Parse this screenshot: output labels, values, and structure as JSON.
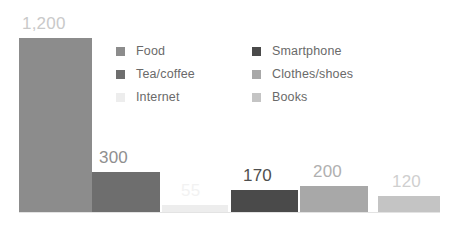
{
  "chart_data": {
    "type": "bar",
    "title": "",
    "subtitle": "",
    "xlabel": "",
    "ylabel": "",
    "grid": false,
    "legend_position": "top-center",
    "categories": [
      "Food",
      "Tea/coffee",
      "Internet",
      "Smartphone",
      "Clothes/shoes",
      "Books"
    ],
    "values": [
      1200,
      300,
      55,
      170,
      200,
      120
    ],
    "value_labels": [
      "1,200",
      "300",
      "55",
      "170",
      "200",
      "120"
    ],
    "colors": [
      "#8c8c8c",
      "#6e6e6e",
      "#ededed",
      "#4a4a4a",
      "#a8a8a8",
      "#c4c4c4"
    ],
    "label_colors": [
      "#c9c9c9",
      "#8f8f8f",
      "#f2f2f2",
      "#4f4f4f",
      "#b0b0b0",
      "#cfcfcf"
    ],
    "bars": [
      {
        "category": "Food",
        "value": 1200,
        "label": "1,200",
        "color": "#8c8c8c",
        "label_color": "#c9c9c9",
        "x": 19,
        "width": 73,
        "top": 38,
        "height": 174,
        "label_x": 22,
        "label_y": 15
      },
      {
        "category": "Tea/coffee",
        "value": 300,
        "label": "300",
        "color": "#6e6e6e",
        "label_color": "#8f8f8f",
        "x": 92,
        "width": 68,
        "top": 172,
        "height": 40,
        "label_x": 99,
        "label_y": 149
      },
      {
        "category": "Internet",
        "value": 55,
        "label": "55",
        "color": "#ededed",
        "label_color": "#f2f2f2",
        "x": 162,
        "width": 66,
        "top": 205,
        "height": 7,
        "label_x": 181,
        "label_y": 182
      },
      {
        "category": "Smartphone",
        "value": 170,
        "label": "170",
        "color": "#4a4a4a",
        "label_color": "#4f4f4f",
        "x": 231,
        "width": 67,
        "top": 190,
        "height": 22,
        "label_x": 243,
        "label_y": 167
      },
      {
        "category": "Clothes/shoes",
        "value": 200,
        "label": "200",
        "color": "#a8a8a8",
        "label_color": "#b0b0b0",
        "x": 300,
        "width": 68,
        "top": 186,
        "height": 26,
        "label_x": 313,
        "label_y": 163
      },
      {
        "category": "Books",
        "value": 120,
        "label": "120",
        "color": "#c4c4c4",
        "label_color": "#cfcfcf",
        "x": 378,
        "width": 62,
        "top": 196,
        "height": 16,
        "label_x": 392,
        "label_y": 173
      }
    ],
    "legend": [
      {
        "label": "Food",
        "color": "#8c8c8c"
      },
      {
        "label": "Smartphone",
        "color": "#4a4a4a"
      },
      {
        "label": "Tea/coffee",
        "color": "#6e6e6e"
      },
      {
        "label": "Clothes/shoes",
        "color": "#a8a8a8"
      },
      {
        "label": "Internet",
        "color": "#ededed"
      },
      {
        "label": "Books",
        "color": "#c4c4c4"
      }
    ]
  }
}
